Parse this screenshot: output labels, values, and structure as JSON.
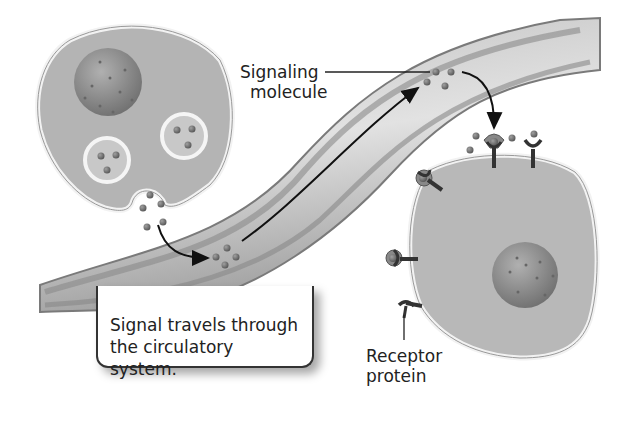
{
  "diagram": {
    "type": "endocrine-signaling",
    "labels": {
      "signaling_molecule": [
        "Signaling",
        "molecule"
      ],
      "receptor_protein": [
        "Receptor",
        "protein"
      ],
      "callout": [
        "Signal travels through",
        "the circulatory system."
      ]
    },
    "elements": {
      "secreting_cell": {
        "vesicles": 2,
        "molecules_per_vesicle": 3,
        "exocytosis_molecules": 5
      },
      "blood_vessel": {
        "molecule_clusters": 2
      },
      "target_cell": {
        "receptors": 5,
        "bound_receptors": 3
      }
    },
    "colors": {
      "cytoplasm": "#b4b4b4",
      "membrane": "#f2f2f2",
      "nucleus": "#8c8c8c",
      "vessel": "#9a9a9a",
      "molecule": "#6e6e6e",
      "receptor": "#3a3a3a",
      "text": "#222222"
    }
  }
}
